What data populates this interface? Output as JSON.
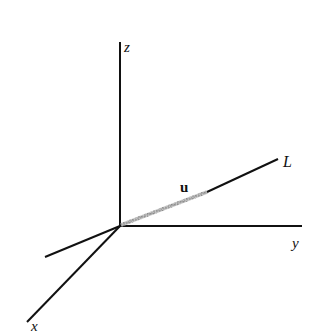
{
  "diagram": {
    "type": "3d-coordinate-axes",
    "colors": {
      "axis": "#111111",
      "vector": "#9a9a9a",
      "background": "#ffffff"
    },
    "origin": [
      120,
      226
    ],
    "axes": {
      "z": {
        "label": "z",
        "from": [
          120,
          226
        ],
        "to": [
          120,
          42
        ],
        "label_pos": [
          124,
          50
        ]
      },
      "y": {
        "label": "y",
        "from": [
          120,
          226
        ],
        "to": [
          302,
          226
        ],
        "label_pos": [
          292,
          248
        ]
      },
      "x": {
        "label": "x",
        "from": [
          120,
          226
        ],
        "to": [
          27,
          322
        ],
        "label_pos": [
          31,
          330
        ]
      },
      "neg_y": {
        "label": "",
        "from": [
          120,
          226
        ],
        "to": [
          45,
          257
        ]
      }
    },
    "line": {
      "label": "L",
      "from": [
        207,
        192
      ],
      "to": [
        278,
        159
      ],
      "label_pos": [
        283,
        166
      ]
    },
    "vector": {
      "label": "u",
      "from": [
        120,
        226
      ],
      "to": [
        207,
        192
      ],
      "label_pos": [
        181,
        191
      ]
    }
  }
}
